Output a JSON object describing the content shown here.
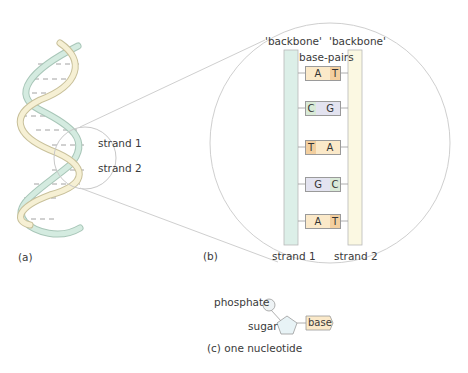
{
  "figure": {
    "panel_a": {
      "label": "(a)",
      "strand1_label": "strand 1",
      "strand2_label": "strand 2"
    },
    "panel_b": {
      "label": "(b)",
      "backbone_left_label": "'backbone'",
      "backbone_right_label": "'backbone'",
      "base_pairs_label": "base-pairs",
      "strand1_label": "strand 1",
      "strand2_label": "strand 2",
      "pairs": [
        {
          "left": "A",
          "right": "T"
        },
        {
          "left": "C",
          "right": "G"
        },
        {
          "left": "T",
          "right": "A"
        },
        {
          "left": "G",
          "right": "C"
        },
        {
          "left": "A",
          "right": "T"
        }
      ]
    },
    "panel_c": {
      "label": "(c)  one nucleotide",
      "phosphate_label": "phosphate",
      "sugar_label": "sugar",
      "base_label": "base"
    },
    "colors": {
      "A": "#fbe9c9",
      "T": "#f3cf9f",
      "C": "#d9ead7",
      "G": "#e3e3f0",
      "strand1": "#dcefe8",
      "strand2": "#fbf7dc",
      "outline": "#a8a8a8"
    }
  }
}
